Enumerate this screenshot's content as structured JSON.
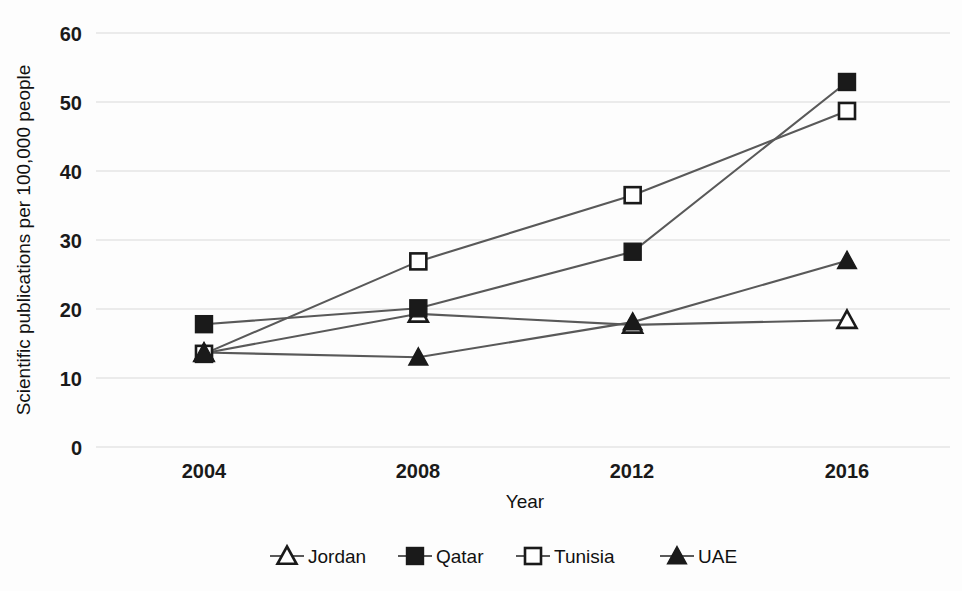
{
  "chart_data": {
    "type": "line",
    "title": "",
    "xlabel": "Year",
    "ylabel": "Scientific publications per 100,000 people",
    "categories": [
      "2004",
      "2008",
      "2012",
      "2016"
    ],
    "x": [
      2004,
      2008,
      2012,
      2016
    ],
    "ylim": [
      0,
      60
    ],
    "ytick_labels": [
      "0",
      "10",
      "20",
      "30",
      "40",
      "50",
      "60"
    ],
    "yticks": [
      0,
      10,
      20,
      30,
      40,
      50,
      60
    ],
    "grid": true,
    "legend_position": "bottom",
    "series": [
      {
        "name": "Jordan",
        "marker": "open-triangle",
        "values": [
          13.6,
          19.3,
          17.7,
          18.4
        ]
      },
      {
        "name": "Qatar",
        "marker": "filled-square",
        "values": [
          17.8,
          20.1,
          28.3,
          52.9
        ]
      },
      {
        "name": "Tunisia",
        "marker": "open-square",
        "values": [
          13.5,
          26.9,
          36.5,
          48.7
        ]
      },
      {
        "name": "UAE",
        "marker": "filled-triangle",
        "values": [
          13.7,
          13.0,
          18.1,
          27.0
        ]
      }
    ],
    "colors": {
      "line": "#595959",
      "marker_fill_dark": "#1a1a1a",
      "marker_fill_light": "#ffffff",
      "gridline": "#d9d9d9",
      "text": "#111111",
      "background": "#fdfdfd"
    }
  },
  "legend": {
    "items": [
      {
        "label": "Jordan",
        "marker": "open-triangle"
      },
      {
        "label": "Qatar",
        "marker": "filled-square"
      },
      {
        "label": "Tunisia",
        "marker": "open-square"
      },
      {
        "label": "UAE",
        "marker": "filled-triangle"
      }
    ]
  }
}
